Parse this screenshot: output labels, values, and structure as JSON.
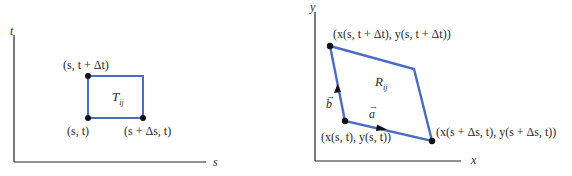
{
  "colors": {
    "region": "#4b6cc1",
    "axis": "#222222",
    "point": "#111111"
  },
  "left_panel": {
    "axis_vertical_label": "t",
    "axis_horizontal_label": "s",
    "region_label": "T",
    "region_label_sub": "ij",
    "corners": {
      "top_left": "(s, t + Δt)",
      "bottom_left": "(s, t)",
      "bottom_right": "(s + Δs, t)"
    }
  },
  "right_panel": {
    "axis_vertical_label": "y",
    "axis_horizontal_label": "x",
    "region_label": "R",
    "region_label_sub": "ij",
    "vector_a": "a",
    "vector_b": "b",
    "corners": {
      "top_left": "(x(s, t + Δt), y(s, t + Δt))",
      "bottom_left": "(x(s, t), y(s, t))",
      "bottom_right": "(x(s + Δs, t), y(s + Δs, t))"
    }
  }
}
